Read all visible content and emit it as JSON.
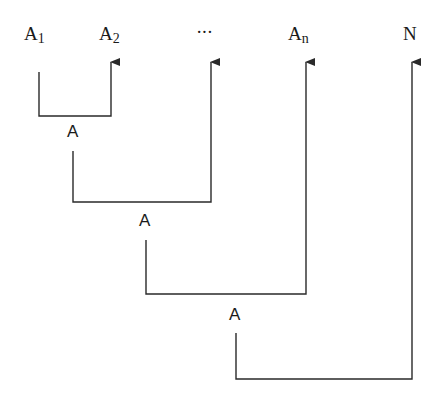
{
  "diagram": {
    "type": "nested-bracket-composition",
    "stroke_color": "#2a2a2a",
    "top_labels": [
      {
        "id": "a1",
        "base": "A",
        "sub": "1"
      },
      {
        "id": "a2",
        "base": "A",
        "sub": "2"
      },
      {
        "id": "ellipsis",
        "base": "···",
        "sub": ""
      },
      {
        "id": "an",
        "base": "A",
        "sub": "n"
      },
      {
        "id": "n",
        "base": "N",
        "sub": ""
      }
    ],
    "combine_labels": [
      {
        "id": "combine-1",
        "text": "A"
      },
      {
        "id": "combine-2",
        "text": "A"
      },
      {
        "id": "combine-3",
        "text": "A"
      }
    ],
    "connections": [
      {
        "from": "A1",
        "to": "A2",
        "result": "A"
      },
      {
        "from": "A",
        "to": "···",
        "result": "A"
      },
      {
        "from": "A",
        "to": "An",
        "result": "A"
      },
      {
        "from": "A",
        "to": "N",
        "result": null
      }
    ]
  }
}
